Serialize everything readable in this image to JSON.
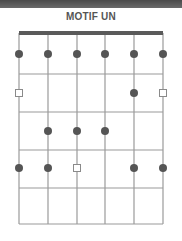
{
  "title": "MOTIF UN",
  "colors": {
    "band": "#555555",
    "nut": "#5a5a5a",
    "grid": "#9a9a9a",
    "dot": "#555555",
    "square_stroke": "#8a8a8a"
  },
  "diagram": {
    "strings": 6,
    "frets": 4,
    "string_x": [
      19,
      48,
      77,
      105,
      134,
      163
    ],
    "nut_y": 33,
    "open_row_y": 54,
    "fret_y": [
      74,
      112,
      150,
      188,
      224
    ],
    "row_y": [
      54,
      93,
      131,
      168
    ],
    "markers": [
      {
        "row": 0,
        "string": 0,
        "type": "dot"
      },
      {
        "row": 0,
        "string": 1,
        "type": "dot"
      },
      {
        "row": 0,
        "string": 2,
        "type": "dot"
      },
      {
        "row": 0,
        "string": 3,
        "type": "dot"
      },
      {
        "row": 0,
        "string": 4,
        "type": "dot"
      },
      {
        "row": 0,
        "string": 5,
        "type": "dot"
      },
      {
        "row": 1,
        "string": 0,
        "type": "square"
      },
      {
        "row": 1,
        "string": 4,
        "type": "dot"
      },
      {
        "row": 1,
        "string": 5,
        "type": "square"
      },
      {
        "row": 2,
        "string": 1,
        "type": "dot"
      },
      {
        "row": 2,
        "string": 2,
        "type": "dot"
      },
      {
        "row": 2,
        "string": 3,
        "type": "dot"
      },
      {
        "row": 3,
        "string": 0,
        "type": "dot"
      },
      {
        "row": 3,
        "string": 1,
        "type": "dot"
      },
      {
        "row": 3,
        "string": 2,
        "type": "square"
      },
      {
        "row": 3,
        "string": 4,
        "type": "dot"
      },
      {
        "row": 3,
        "string": 5,
        "type": "dot"
      }
    ]
  }
}
